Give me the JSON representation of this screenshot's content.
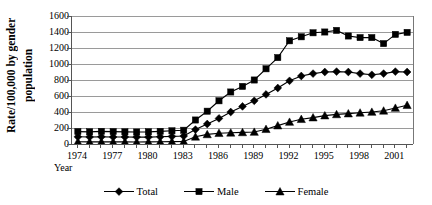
{
  "chart_data": {
    "type": "line",
    "title": "",
    "xlabel": "Year",
    "ylabel": "Rate/100,000 by gender population",
    "ylabel_line_1": "Rate/100,000 by gender",
    "ylabel_line_2": "population",
    "ylim": [
      0,
      1600
    ],
    "ytick_step": 200,
    "yticks": [
      1600,
      1400,
      1200,
      1000,
      800,
      600,
      400,
      200,
      0
    ],
    "grid": true,
    "legend_position": "bottom",
    "x": [
      1974,
      1975,
      1976,
      1977,
      1978,
      1979,
      1980,
      1981,
      1982,
      1983,
      1984,
      1985,
      1986,
      1987,
      1988,
      1989,
      1990,
      1991,
      1992,
      1993,
      1994,
      1995,
      1996,
      1997,
      1998,
      1999,
      2000,
      2001,
      2002
    ],
    "xtick_labels": [
      "1974",
      "1977",
      "1980",
      "1983",
      "1986",
      "1989",
      "1992",
      "1995",
      "1998",
      "2001"
    ],
    "xtick_years": [
      1974,
      1977,
      1980,
      1983,
      1986,
      1989,
      1992,
      1995,
      1998,
      2001
    ],
    "series": [
      {
        "name": "Total",
        "marker": "diamond",
        "color": "#000000",
        "values": [
          90,
          88,
          90,
          88,
          88,
          86,
          86,
          90,
          95,
          100,
          180,
          250,
          320,
          400,
          470,
          540,
          620,
          700,
          790,
          850,
          880,
          900,
          905,
          900,
          880,
          865,
          880,
          905,
          900
        ]
      },
      {
        "name": "Male",
        "marker": "square",
        "color": "#000000",
        "values": [
          155,
          152,
          158,
          155,
          152,
          150,
          152,
          158,
          165,
          172,
          300,
          410,
          540,
          650,
          720,
          800,
          940,
          1080,
          1290,
          1340,
          1390,
          1400,
          1420,
          1350,
          1330,
          1330,
          1255,
          1370,
          1395
        ]
      },
      {
        "name": "Female",
        "marker": "triangle",
        "color": "#000000",
        "values": [
          28,
          26,
          28,
          26,
          26,
          25,
          26,
          28,
          30,
          32,
          90,
          120,
          135,
          140,
          145,
          150,
          185,
          230,
          275,
          310,
          330,
          355,
          370,
          380,
          390,
          400,
          415,
          450,
          485
        ]
      }
    ]
  },
  "legend": {
    "items": [
      {
        "label": "Total",
        "marker": "diamond"
      },
      {
        "label": "Male",
        "marker": "square"
      },
      {
        "label": "Female",
        "marker": "triangle"
      }
    ]
  }
}
